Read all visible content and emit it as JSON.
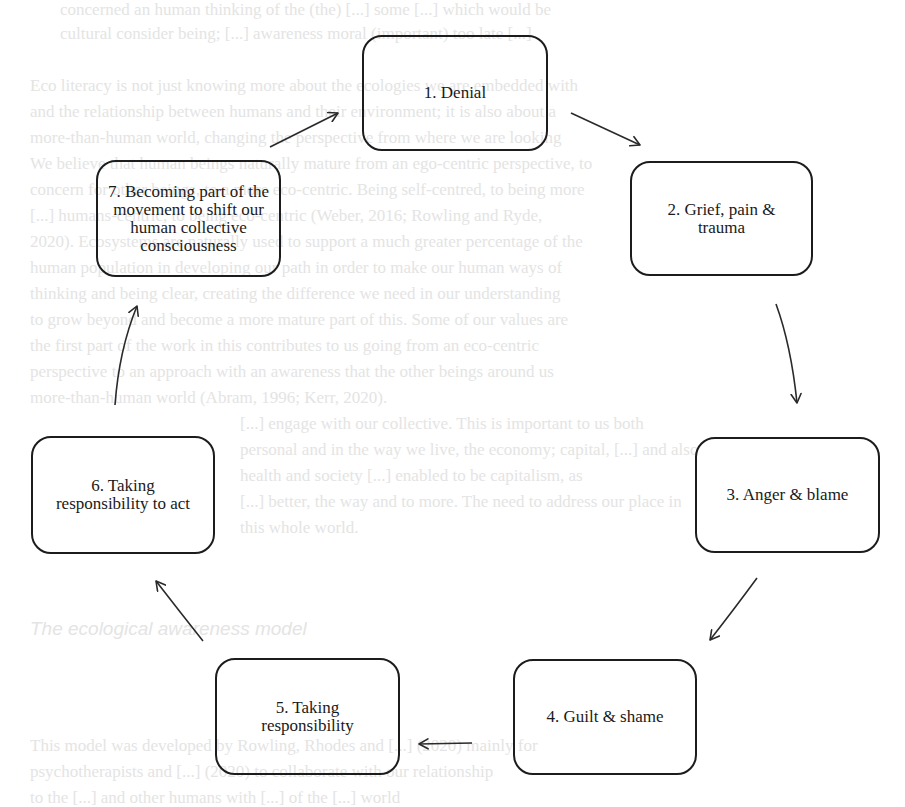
{
  "diagram": {
    "type": "cycle",
    "stages": [
      {
        "id": 1,
        "label": "1. Denial"
      },
      {
        "id": 2,
        "label": "2. Grief, pain & trauma"
      },
      {
        "id": 3,
        "label": "3. Anger & blame"
      },
      {
        "id": 4,
        "label": "4. Guilt & shame"
      },
      {
        "id": 5,
        "label": "5. Taking responsibility"
      },
      {
        "id": 6,
        "label": "6. Taking responsibility to act"
      },
      {
        "id": 7,
        "label": "7. Becoming part of the movement to shift our human collective consciousness"
      }
    ],
    "edges": [
      {
        "from": 1,
        "to": 2
      },
      {
        "from": 2,
        "to": 3
      },
      {
        "from": 3,
        "to": 4
      },
      {
        "from": 4,
        "to": 5
      },
      {
        "from": 5,
        "to": 6
      },
      {
        "from": 6,
        "to": 7
      },
      {
        "from": 7,
        "to": 1
      }
    ]
  },
  "background": {
    "note": "faint show-through text from reverse side of page",
    "heading": "The ecological awareness model",
    "lines": [
      "concerned an human thinking of the (the) [...] some [...] which would be",
      "cultural consider being; [...] awareness moral (important) too late [...]",
      "Eco literacy is not just knowing more about the ecologies we are embedded with",
      "and the relationship between humans and their environment; it is also about a",
      "more-than-human world, changing the perspective from where we are looking",
      "We believe that human beings naturally mature from an ego-centric perspective, to",
      "concern for other beings, to a more eco-centric. Being self-centred, to being more",
      "[...] humans-centric, to being eco-centric (Weber, 2016; Rowling and Ryde,",
      "2020). Ecosystems are naturally used to support a much greater percentage of the",
      "human population in developing our path in order to make our human ways of",
      "thinking and being clear, creating the difference we need in our understanding",
      "to grow beyond and become a more mature part of this. Some of our values are",
      "the first part of the work in this contributes to us going from an eco-centric",
      "perspective to an approach with an awareness that the other beings around us",
      "more-than-human world (Abram, 1996; Kerr, 2020).",
      "[...] engage with our collective. This is important to us both",
      "personal and in the way we live, the economy; capital, [...] and also",
      "health and society [...] enabled to be capitalism, as",
      "[...] better, the way and to more. The need to address our place in",
      "this whole world.",
      "This model was developed by Rowling, Rhodes and [...] (2020) mainly for",
      "psychotherapists and [...] (2020) to collaborate with our relationship",
      "to the [...] and other humans with [...] of the [...] world"
    ]
  }
}
